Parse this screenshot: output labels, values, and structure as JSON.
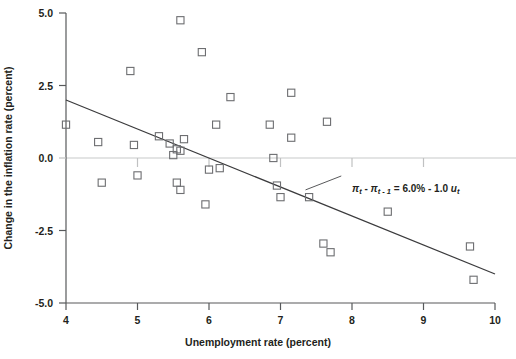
{
  "chart_data": {
    "type": "scatter",
    "title": "",
    "xlabel": "Unemployment rate (percent)",
    "ylabel": "Change in the inflation rate (percent)",
    "xlim": [
      4,
      10
    ],
    "ylim": [
      -5.0,
      5.0
    ],
    "xticks": [
      "4",
      "5",
      "6",
      "7",
      "8",
      "9",
      "10"
    ],
    "yticks": [
      "5.0",
      "2.5",
      "0.0",
      "-2.5",
      "-5.0"
    ],
    "ytick_values": [
      5.0,
      2.5,
      0.0,
      -2.5,
      -5.0
    ],
    "xtick_values": [
      4,
      5,
      6,
      7,
      8,
      9,
      10
    ],
    "grid": false,
    "legend": "none",
    "marker": "open-square",
    "points": [
      {
        "x": 4.0,
        "y": 1.15
      },
      {
        "x": 4.45,
        "y": 0.55
      },
      {
        "x": 4.5,
        "y": -0.85
      },
      {
        "x": 4.9,
        "y": 3.0
      },
      {
        "x": 4.95,
        "y": 0.45
      },
      {
        "x": 5.0,
        "y": -0.6
      },
      {
        "x": 5.3,
        "y": 0.75
      },
      {
        "x": 5.45,
        "y": 0.5
      },
      {
        "x": 5.5,
        "y": 0.1
      },
      {
        "x": 5.55,
        "y": 0.3
      },
      {
        "x": 5.6,
        "y": 0.25
      },
      {
        "x": 5.6,
        "y": 4.75
      },
      {
        "x": 5.65,
        "y": 0.65
      },
      {
        "x": 5.6,
        "y": -1.1
      },
      {
        "x": 5.55,
        "y": -0.85
      },
      {
        "x": 5.9,
        "y": 3.65
      },
      {
        "x": 6.0,
        "y": -0.4
      },
      {
        "x": 5.95,
        "y": -1.6
      },
      {
        "x": 6.1,
        "y": 1.15
      },
      {
        "x": 6.15,
        "y": -0.35
      },
      {
        "x": 6.3,
        "y": 2.1
      },
      {
        "x": 6.85,
        "y": 1.15
      },
      {
        "x": 6.9,
        "y": 0.0
      },
      {
        "x": 6.95,
        "y": -0.95
      },
      {
        "x": 7.0,
        "y": -1.35
      },
      {
        "x": 7.15,
        "y": 2.25
      },
      {
        "x": 7.15,
        "y": 0.7
      },
      {
        "x": 7.4,
        "y": -1.35
      },
      {
        "x": 7.6,
        "y": -2.95
      },
      {
        "x": 7.65,
        "y": 1.25
      },
      {
        "x": 7.7,
        "y": -3.25
      },
      {
        "x": 8.5,
        "y": -1.85
      },
      {
        "x": 9.65,
        "y": -3.05
      },
      {
        "x": 9.7,
        "y": -4.2
      }
    ],
    "fit_line": {
      "label_text": "= 6.0% - 1.0",
      "label_lhs_pi": "π",
      "label_lhs_sub_t": "t",
      "label_minus": "-",
      "label_lhs_sub_t1": "t - 1",
      "label_rhs_u": "u",
      "label_rhs_sub_t": "t",
      "intercept": 6.0,
      "slope": -1.0,
      "x_start": 4.0,
      "y_start": 2.0,
      "x_end": 10.0,
      "y_end": -4.0
    },
    "annotation": {
      "equation_full": "πt − πt−1 = 6.0% − 1.0 ut",
      "leader_from": {
        "x": 7.35,
        "y": -1.1
      },
      "leader_to": {
        "x": 7.85,
        "y": -0.62
      }
    }
  }
}
